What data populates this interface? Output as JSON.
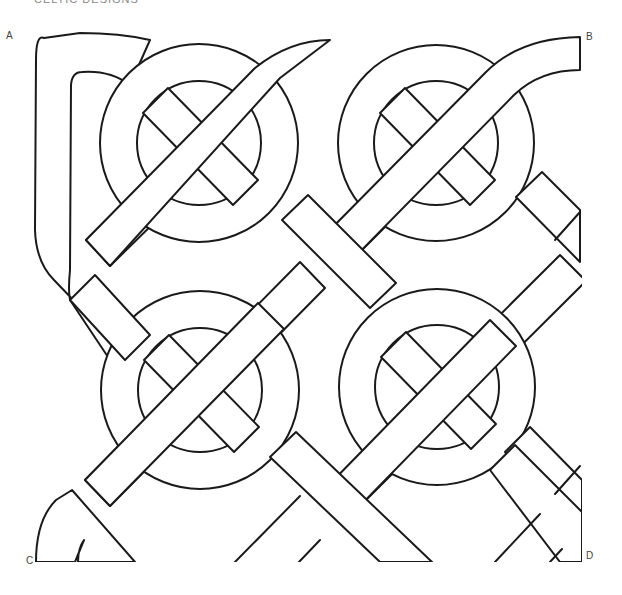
{
  "header": {
    "title": "CELTIC DESIGNS"
  },
  "figure": {
    "type": "celtic-knot-line-drawing",
    "rings": 4,
    "grid": "2x2",
    "corner_labels": {
      "a": "A",
      "b": "B",
      "c": "C",
      "d": "D"
    }
  },
  "colors": {
    "ink": "#1a1a1a",
    "paper": "#ffffff",
    "label": "#444444"
  }
}
